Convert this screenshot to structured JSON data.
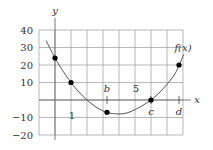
{
  "chart_data": {
    "type": "line",
    "title": "",
    "xlabel": "x",
    "ylabel": "y",
    "series_label": "f(x)",
    "xlim": [
      -1,
      8
    ],
    "ylim": [
      -20,
      40
    ],
    "grid": true,
    "x_tick_labels": [
      {
        "x": 1,
        "label": "1"
      },
      {
        "x": 5,
        "label": "5"
      }
    ],
    "y_ticks": [
      40,
      30,
      20,
      10,
      -10,
      -20
    ],
    "y_tick_labels": [
      "40",
      "30",
      "20",
      "10",
      "−10",
      "−20"
    ],
    "curve": {
      "x": [
        -0.56,
        0,
        0.5,
        1,
        1.5,
        2,
        2.5,
        3,
        3.25,
        3.5,
        4,
        4.5,
        5,
        5.5,
        6,
        6.5,
        7,
        7.5,
        7.75,
        8.05
      ],
      "y": [
        34,
        24,
        16.5,
        10,
        4.5,
        0,
        -3.6,
        -6.2,
        -7,
        -7.6,
        -8,
        -7.4,
        -5.5,
        -3,
        0,
        4,
        9,
        15,
        20,
        26
      ]
    },
    "marked_points": [
      {
        "x": 0,
        "y": 24,
        "label": ""
      },
      {
        "x": 1,
        "y": 10,
        "label": ""
      },
      {
        "x": 3.25,
        "y": -7,
        "label": "b"
      },
      {
        "x": 6,
        "y": 0,
        "label": "c"
      },
      {
        "x": 7.75,
        "y": 20,
        "label": "d"
      }
    ],
    "axis_markers": [
      {
        "x": 3.25,
        "label": "b"
      },
      {
        "x": 6,
        "label": "c"
      },
      {
        "x": 7.75,
        "label": "d"
      }
    ]
  }
}
